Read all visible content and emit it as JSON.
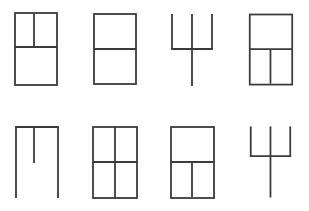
{
  "canvas": {
    "width": 309,
    "height": 211,
    "background_color": "#ffffff",
    "stroke_color": "#3b3b3b",
    "stroke_width": 1.8,
    "title": "Window and trident pictogram icon sheet",
    "grid": {
      "columns": 4,
      "rows": 2,
      "cell_width": 77,
      "cell_height": 105
    }
  },
  "icons": [
    {
      "id": "icon-1",
      "name": "window-upper-split-vertical",
      "label": "Window with small upper sash split vertically",
      "row": 1,
      "column": 1,
      "origin": {
        "x": 0,
        "y": 0
      },
      "box": {
        "x": 15,
        "y": 13,
        "width": 42,
        "height": 72
      },
      "strokes": [
        {
          "kind": "rect",
          "x1": 15,
          "y1": 13,
          "x2": 57,
          "y2": 85
        },
        {
          "kind": "horizontal-divider",
          "x1": 15,
          "y1": 47,
          "x2": 57,
          "y2": 47
        },
        {
          "kind": "vertical-divider-upper",
          "x1": 34,
          "y1": 13,
          "x2": 34,
          "y2": 47
        }
      ]
    },
    {
      "id": "icon-2",
      "name": "window-two-sash-horizontal",
      "label": "Window split once horizontally",
      "row": 1,
      "column": 2,
      "origin": {
        "x": 77,
        "y": 0
      },
      "box": {
        "x": 94,
        "y": 14,
        "width": 42,
        "height": 70
      },
      "strokes": [
        {
          "kind": "rect",
          "x1": 94,
          "y1": 14,
          "x2": 136,
          "y2": 84
        },
        {
          "kind": "horizontal-divider",
          "x1": 94,
          "y1": 49,
          "x2": 136,
          "y2": 49
        }
      ]
    },
    {
      "id": "icon-3",
      "name": "trident-tall",
      "label": "Trident with three prongs and long stem",
      "row": 1,
      "column": 3,
      "origin": {
        "x": 154,
        "y": 0
      },
      "box": {
        "x": 172,
        "y": 14,
        "width": 40,
        "height": 72
      },
      "strokes": [
        {
          "kind": "prong-left",
          "x1": 172,
          "y1": 14,
          "x2": 172,
          "y2": 49
        },
        {
          "kind": "prong-center",
          "x1": 192,
          "y1": 14,
          "x2": 192,
          "y2": 86
        },
        {
          "kind": "prong-right",
          "x1": 212,
          "y1": 14,
          "x2": 212,
          "y2": 49
        },
        {
          "kind": "crossbar",
          "x1": 172,
          "y1": 49,
          "x2": 212,
          "y2": 49
        }
      ]
    },
    {
      "id": "icon-4",
      "name": "window-lower-split-vertical",
      "label": "Window with lower sash split vertically",
      "row": 1,
      "column": 4,
      "origin": {
        "x": 231,
        "y": 0
      },
      "box": {
        "x": 250,
        "y": 14,
        "width": 43,
        "height": 71
      },
      "strokes": [
        {
          "kind": "rect",
          "x1": 250,
          "y1": 14,
          "x2": 293,
          "y2": 85
        },
        {
          "kind": "horizontal-divider",
          "x1": 250,
          "y1": 49,
          "x2": 293,
          "y2": 49
        },
        {
          "kind": "vertical-divider-lower",
          "x1": 271,
          "y1": 49,
          "x2": 271,
          "y2": 85
        }
      ]
    },
    {
      "id": "icon-5",
      "name": "open-frame-with-center-stem",
      "label": "Open frame, legs down, short centre stem",
      "row": 2,
      "column": 1,
      "origin": {
        "x": 0,
        "y": 106
      },
      "box": {
        "x": 16,
        "y": 127,
        "width": 42,
        "height": 71
      },
      "strokes": [
        {
          "kind": "crossbar-top",
          "x1": 16,
          "y1": 127,
          "x2": 58,
          "y2": 127
        },
        {
          "kind": "leg-left",
          "x1": 16,
          "y1": 127,
          "x2": 16,
          "y2": 198
        },
        {
          "kind": "leg-right",
          "x1": 58,
          "y1": 127,
          "x2": 58,
          "y2": 198
        },
        {
          "kind": "center-stem",
          "x1": 34,
          "y1": 127,
          "x2": 34,
          "y2": 163
        }
      ]
    },
    {
      "id": "icon-6",
      "name": "window-four-pane-grid",
      "label": "Window divided into four equal panes",
      "row": 2,
      "column": 2,
      "origin": {
        "x": 77,
        "y": 106
      },
      "box": {
        "x": 93,
        "y": 127,
        "width": 44,
        "height": 71
      },
      "strokes": [
        {
          "kind": "rect",
          "x1": 93,
          "y1": 127,
          "x2": 137,
          "y2": 198
        },
        {
          "kind": "horizontal-divider",
          "x1": 93,
          "y1": 162,
          "x2": 137,
          "y2": 162
        },
        {
          "kind": "vertical-divider-full",
          "x1": 115,
          "y1": 127,
          "x2": 115,
          "y2": 198
        }
      ]
    },
    {
      "id": "icon-7",
      "name": "window-lower-split-vertical-2",
      "label": "Window with lower sash split vertically",
      "row": 2,
      "column": 3,
      "origin": {
        "x": 154,
        "y": 106
      },
      "box": {
        "x": 171,
        "y": 127,
        "width": 43,
        "height": 71
      },
      "strokes": [
        {
          "kind": "rect",
          "x1": 171,
          "y1": 127,
          "x2": 214,
          "y2": 198
        },
        {
          "kind": "horizontal-divider",
          "x1": 171,
          "y1": 162,
          "x2": 214,
          "y2": 162
        },
        {
          "kind": "vertical-divider-lower",
          "x1": 192,
          "y1": 162,
          "x2": 192,
          "y2": 198
        }
      ]
    },
    {
      "id": "icon-8",
      "name": "trident-compact",
      "label": "Compact trident with three prongs and stem",
      "row": 2,
      "column": 4,
      "origin": {
        "x": 231,
        "y": 106
      },
      "box": {
        "x": 251,
        "y": 126,
        "width": 40,
        "height": 72
      },
      "strokes": [
        {
          "kind": "prong-left",
          "x1": 251,
          "y1": 126,
          "x2": 251,
          "y2": 156
        },
        {
          "kind": "prong-center",
          "x1": 271,
          "y1": 126,
          "x2": 271,
          "y2": 198
        },
        {
          "kind": "prong-right",
          "x1": 291,
          "y1": 126,
          "x2": 291,
          "y2": 156
        },
        {
          "kind": "crossbar",
          "x1": 251,
          "y1": 156,
          "x2": 291,
          "y2": 156
        }
      ]
    }
  ]
}
